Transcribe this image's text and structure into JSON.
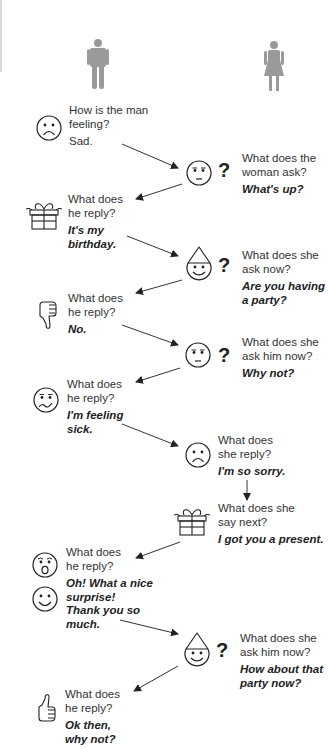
{
  "figures": {
    "man": {
      "label": "man",
      "color": "#9a9a9a"
    },
    "woman": {
      "label": "woman",
      "color": "#9a9a9a"
    }
  },
  "steps": [
    {
      "speaker": "man",
      "icon": "sad-face-icon",
      "question": "How is the man feeling?",
      "question_lines": [
        "How is the man",
        "feeling?"
      ],
      "answer_lines": [
        "Sad."
      ],
      "answer_italic": false
    },
    {
      "speaker": "woman",
      "icon": "concerned-face-icon",
      "has_question_mark": true,
      "question_lines": [
        "What does the",
        "woman ask?"
      ],
      "answer_lines": [
        "What's up?"
      ]
    },
    {
      "speaker": "man",
      "icon": "gift-icon",
      "question_lines": [
        "What does",
        "he reply?"
      ],
      "answer_lines": [
        "It's my",
        "birthday."
      ]
    },
    {
      "speaker": "woman",
      "icon": "party-hat-face-icon",
      "has_question_mark": true,
      "question_lines": [
        "What does she",
        "ask now?"
      ],
      "answer_lines": [
        "Are you having",
        "a party?"
      ]
    },
    {
      "speaker": "man",
      "icon": "thumbs-down-icon",
      "question_lines": [
        "What does",
        "he reply?"
      ],
      "answer_lines": [
        "No."
      ]
    },
    {
      "speaker": "woman",
      "icon": "concerned-face-icon",
      "has_question_mark": true,
      "question_lines": [
        "What does she",
        "ask him now?"
      ],
      "answer_lines": [
        "Why not?"
      ]
    },
    {
      "speaker": "man",
      "icon": "sick-face-icon",
      "question_lines": [
        "What does",
        "he reply?"
      ],
      "answer_lines": [
        "I'm feeling",
        "sick."
      ]
    },
    {
      "speaker": "woman",
      "icon": "sad-face-icon",
      "question_lines": [
        "What does",
        "she reply?"
      ],
      "answer_lines": [
        "I'm so sorry."
      ]
    },
    {
      "speaker": "woman",
      "icon": "gift-icon",
      "question_lines": [
        "What does she",
        "say next?"
      ],
      "answer_lines": [
        "I got you a present."
      ]
    },
    {
      "speaker": "man",
      "icon": "surprised-face-icon",
      "icon2": "happy-face-icon",
      "question_lines": [
        "What does",
        "he reply?"
      ],
      "answer_lines": [
        "Oh! What a nice",
        "surprise!",
        "Thank you so",
        "much."
      ]
    },
    {
      "speaker": "woman",
      "icon": "party-hat-face-icon",
      "has_question_mark": true,
      "question_lines": [
        "What does she",
        "ask him now?"
      ],
      "answer_lines": [
        "How about that",
        "party now?"
      ]
    },
    {
      "speaker": "man",
      "icon": "thumbs-up-icon",
      "question_lines": [
        "What does",
        "he reply?"
      ],
      "answer_lines": [
        "Ok then,",
        "why not?"
      ]
    }
  ],
  "question_mark": "?"
}
